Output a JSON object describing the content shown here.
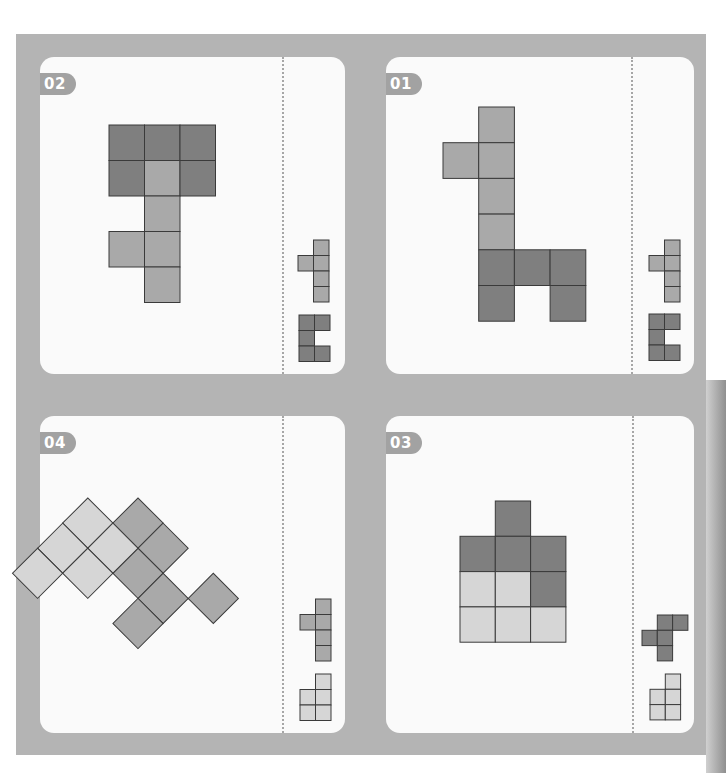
{
  "colors": {
    "board": "#b4b4b4",
    "card": "#fafafa",
    "dark": "#7f7f7f",
    "mid": "#a9a9a9",
    "light": "#d6d6d6",
    "stroke": "#3a3a3a",
    "divider": "#a6a6a6",
    "badge": "#a2a2a2"
  },
  "puzzles": [
    {
      "id": "02",
      "label": "02",
      "card": {
        "x": 40,
        "y": 57,
        "w": 305,
        "h": 317
      },
      "divider_x": 282,
      "target": {
        "origin": [
          109,
          125
        ],
        "cell": 35.5,
        "rotate": 0,
        "cells": [
          {
            "r": 0,
            "c": 0,
            "tone": "dark"
          },
          {
            "r": 0,
            "c": 1,
            "tone": "dark"
          },
          {
            "r": 0,
            "c": 2,
            "tone": "dark"
          },
          {
            "r": 1,
            "c": 0,
            "tone": "dark"
          },
          {
            "r": 1,
            "c": 1,
            "tone": "mid"
          },
          {
            "r": 1,
            "c": 2,
            "tone": "dark"
          },
          {
            "r": 2,
            "c": 1,
            "tone": "mid"
          },
          {
            "r": 3,
            "c": 0,
            "tone": "mid"
          },
          {
            "r": 3,
            "c": 1,
            "tone": "mid"
          },
          {
            "r": 4,
            "c": 1,
            "tone": "mid"
          }
        ]
      },
      "pieces": [
        {
          "origin": [
            298,
            240
          ],
          "cell": 15.5,
          "tone": "mid",
          "cells": [
            [
              0,
              1
            ],
            [
              1,
              0
            ],
            [
              1,
              1
            ],
            [
              2,
              1
            ],
            [
              3,
              1
            ]
          ]
        },
        {
          "origin": [
            299,
            315
          ],
          "cell": 15.5,
          "tone": "dark",
          "cells": [
            [
              0,
              0
            ],
            [
              0,
              1
            ],
            [
              1,
              0
            ],
            [
              2,
              0
            ],
            [
              2,
              1
            ]
          ]
        }
      ]
    },
    {
      "id": "01",
      "label": "01",
      "card": {
        "x": 386,
        "y": 57,
        "w": 308,
        "h": 317
      },
      "divider_x": 631,
      "target": {
        "origin": [
          443,
          107
        ],
        "cell": 35.7,
        "rotate": 0,
        "cells": [
          {
            "r": 0,
            "c": 1,
            "tone": "mid"
          },
          {
            "r": 1,
            "c": 0,
            "tone": "mid"
          },
          {
            "r": 1,
            "c": 1,
            "tone": "mid"
          },
          {
            "r": 2,
            "c": 1,
            "tone": "mid"
          },
          {
            "r": 3,
            "c": 1,
            "tone": "mid"
          },
          {
            "r": 4,
            "c": 1,
            "tone": "dark"
          },
          {
            "r": 4,
            "c": 2,
            "tone": "dark"
          },
          {
            "r": 4,
            "c": 3,
            "tone": "dark"
          },
          {
            "r": 5,
            "c": 1,
            "tone": "dark"
          },
          {
            "r": 5,
            "c": 3,
            "tone": "dark"
          }
        ]
      },
      "pieces": [
        {
          "origin": [
            649,
            240
          ],
          "cell": 15.5,
          "tone": "mid",
          "cells": [
            [
              0,
              1
            ],
            [
              1,
              0
            ],
            [
              1,
              1
            ],
            [
              2,
              1
            ],
            [
              3,
              1
            ]
          ]
        },
        {
          "origin": [
            649,
            314
          ],
          "cell": 15.5,
          "tone": "dark",
          "cells": [
            [
              0,
              0
            ],
            [
              0,
              1
            ],
            [
              1,
              0
            ],
            [
              2,
              0
            ],
            [
              2,
              1
            ]
          ]
        }
      ]
    },
    {
      "id": "04",
      "label": "04",
      "card": {
        "x": 40,
        "y": 416,
        "w": 305,
        "h": 317
      },
      "divider_x": 282,
      "target": {
        "origin": [
          138,
          498
        ],
        "cell": 35.5,
        "rotate": 45,
        "cells": [
          {
            "r": 0,
            "c": 0,
            "tone": "mid"
          },
          {
            "r": 0,
            "c": 1,
            "tone": "mid"
          },
          {
            "r": 0,
            "c": 3,
            "tone": "mid"
          },
          {
            "r": 1,
            "c": -1,
            "tone": "light"
          },
          {
            "r": 1,
            "c": 1,
            "tone": "mid"
          },
          {
            "r": 1,
            "c": 2,
            "tone": "mid"
          },
          {
            "r": 0,
            "c": 2,
            "tone": "hidden"
          },
          {
            "r": 1,
            "c": 0,
            "tone": "light"
          },
          {
            "r": 2,
            "c": -1,
            "tone": "light"
          },
          {
            "r": 2,
            "c": 0,
            "tone": "light"
          },
          {
            "r": 2,
            "c": 2,
            "tone": "mid"
          },
          {
            "r": 3,
            "c": -1,
            "tone": "light"
          }
        ]
      },
      "pieces": [
        {
          "origin": [
            300,
            599
          ],
          "cell": 15.5,
          "tone": "mid",
          "cells": [
            [
              0,
              1
            ],
            [
              1,
              0
            ],
            [
              1,
              1
            ],
            [
              2,
              1
            ],
            [
              3,
              1
            ]
          ]
        },
        {
          "origin": [
            300,
            674
          ],
          "cell": 15.5,
          "tone": "light",
          "cells": [
            [
              0,
              1
            ],
            [
              1,
              0
            ],
            [
              1,
              1
            ],
            [
              2,
              0
            ],
            [
              2,
              1
            ]
          ]
        }
      ]
    },
    {
      "id": "03",
      "label": "03",
      "card": {
        "x": 386,
        "y": 416,
        "w": 308,
        "h": 317
      },
      "divider_x": 632,
      "target": {
        "origin": [
          460,
          501
        ],
        "cell": 35.3,
        "rotate": 0,
        "cells": [
          {
            "r": 0,
            "c": 1,
            "tone": "dark"
          },
          {
            "r": 1,
            "c": 0,
            "tone": "dark"
          },
          {
            "r": 1,
            "c": 1,
            "tone": "dark"
          },
          {
            "r": 1,
            "c": 2,
            "tone": "dark"
          },
          {
            "r": 2,
            "c": 0,
            "tone": "light"
          },
          {
            "r": 2,
            "c": 1,
            "tone": "light"
          },
          {
            "r": 2,
            "c": 2,
            "tone": "dark"
          },
          {
            "r": 3,
            "c": 0,
            "tone": "light"
          },
          {
            "r": 3,
            "c": 1,
            "tone": "light"
          },
          {
            "r": 3,
            "c": 2,
            "tone": "light"
          }
        ]
      },
      "pieces": [
        {
          "origin": [
            642,
            615
          ],
          "cell": 15.3,
          "tone": "dark",
          "cells": [
            [
              0,
              1
            ],
            [
              0,
              2
            ],
            [
              1,
              0
            ],
            [
              1,
              1
            ],
            [
              2,
              1
            ]
          ]
        },
        {
          "origin": [
            650,
            674
          ],
          "cell": 15.3,
          "tone": "light",
          "cells": [
            [
              0,
              1
            ],
            [
              1,
              0
            ],
            [
              1,
              1
            ],
            [
              2,
              0
            ],
            [
              2,
              1
            ]
          ]
        }
      ]
    }
  ]
}
